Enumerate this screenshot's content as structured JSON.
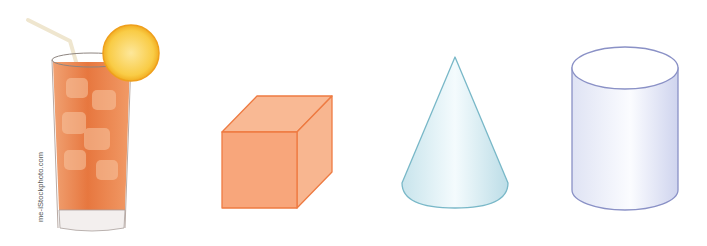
{
  "figure": {
    "items": [
      {
        "name": "iced-tea-glass",
        "label": "Glass of iced tea with lemon slice and straw",
        "colors": {
          "liquid": "#e9804a",
          "lemon": "#f8c33a",
          "glass_edge": "#9a8c86"
        }
      },
      {
        "name": "cube",
        "label": "Cube",
        "colors": {
          "fill": "#f8ab80",
          "stroke": "#ee7b42"
        }
      },
      {
        "name": "cone",
        "label": "Cone",
        "colors": {
          "fill": "#d4ecf1",
          "stroke": "#79b8c8"
        }
      },
      {
        "name": "cylinder",
        "label": "Cylinder",
        "colors": {
          "fill": "#e6e9f6",
          "stroke": "#8a91c6"
        }
      }
    ],
    "watermark": "me-iStockphoto.com"
  }
}
